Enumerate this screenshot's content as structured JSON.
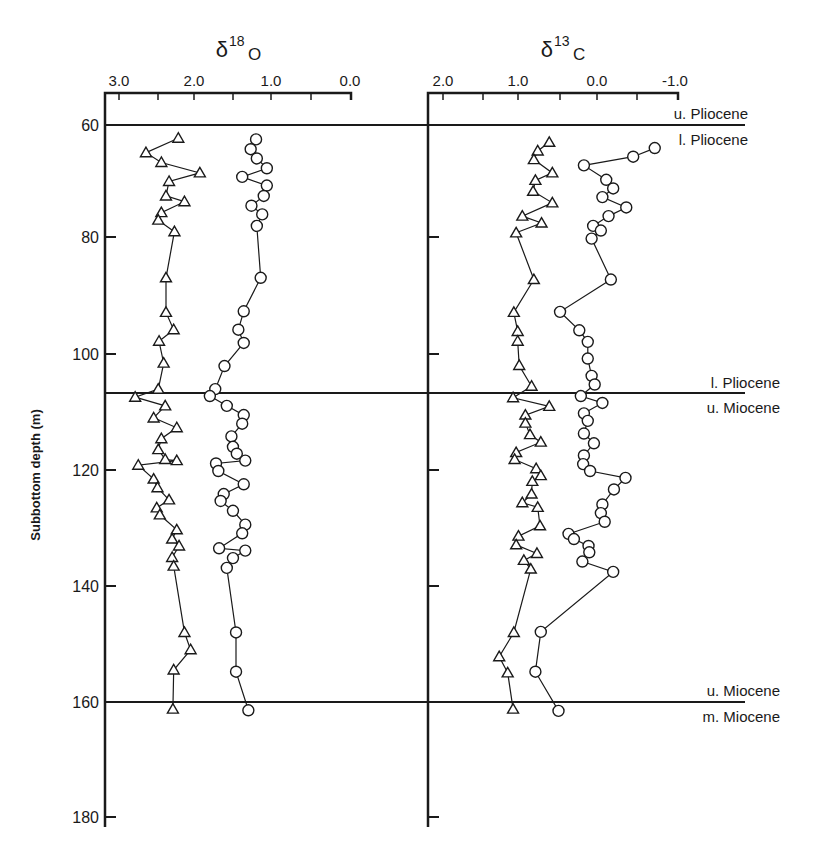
{
  "chart_data": [
    {
      "type": "line",
      "panel": "left",
      "title": "δ18O",
      "title_parts": {
        "base": "δ",
        "sup": "18",
        "sub": "O"
      },
      "xlabel": "δ18O",
      "ylabel": "Subbottom depth (m)",
      "x_ticks": [
        "3.0",
        "2.0",
        "1.0",
        "0.0"
      ],
      "x_tick_values": [
        3.0,
        2.0,
        1.0,
        0.0
      ],
      "xlim": [
        3.1,
        0.0
      ],
      "x_reversed": true,
      "y_ticks": [
        "60",
        "80",
        "100",
        "120",
        "140",
        "160",
        "180"
      ],
      "y_tick_values": [
        60,
        80,
        100,
        120,
        140,
        160,
        180
      ],
      "ylim": [
        55,
        182
      ],
      "y_reversed": true,
      "grid": false,
      "series": [
        {
          "name": "triangles",
          "marker": "triangle",
          "points": [
            [
              2.23,
              62.3
            ],
            [
              2.65,
              64.8
            ],
            [
              2.45,
              66.5
            ],
            [
              1.95,
              68.3
            ],
            [
              2.35,
              69.8
            ],
            [
              2.39,
              72.3
            ],
            [
              2.15,
              73.3
            ],
            [
              2.45,
              75.2
            ],
            [
              2.49,
              76.5
            ],
            [
              2.28,
              78.5
            ],
            [
              2.39,
              86.5
            ],
            [
              2.39,
              92.5
            ],
            [
              2.29,
              95.5
            ],
            [
              2.48,
              97.5
            ],
            [
              2.42,
              101.3
            ],
            [
              2.49,
              105.8
            ],
            [
              2.79,
              107.2
            ],
            [
              2.4,
              108.7
            ],
            [
              2.55,
              110.8
            ],
            [
              2.25,
              112.5
            ],
            [
              2.45,
              114.4
            ],
            [
              2.49,
              116.3
            ],
            [
              2.4,
              118.0
            ],
            [
              2.25,
              118.2
            ],
            [
              2.75,
              119.0
            ],
            [
              2.55,
              121.4
            ],
            [
              2.5,
              122.9
            ],
            [
              2.35,
              125.0
            ],
            [
              2.51,
              126.4
            ],
            [
              2.47,
              127.6
            ],
            [
              2.25,
              130.2
            ],
            [
              2.31,
              131.8
            ],
            [
              2.22,
              133.0
            ],
            [
              2.31,
              135.0
            ],
            [
              2.29,
              136.5
            ],
            [
              2.15,
              148.0
            ],
            [
              2.07,
              151.0
            ],
            [
              2.29,
              154.5
            ],
            [
              2.3,
              161.3
            ]
          ]
        },
        {
          "name": "circles",
          "marker": "circle",
          "points": [
            [
              1.22,
              62.5
            ],
            [
              1.29,
              64.2
            ],
            [
              1.21,
              65.8
            ],
            [
              1.08,
              67.5
            ],
            [
              1.4,
              69.0
            ],
            [
              1.08,
              70.5
            ],
            [
              1.12,
              72.3
            ],
            [
              1.28,
              74.0
            ],
            [
              1.14,
              75.5
            ],
            [
              1.21,
              77.5
            ],
            [
              1.16,
              86.5
            ],
            [
              1.38,
              92.3
            ],
            [
              1.45,
              95.5
            ],
            [
              1.38,
              97.8
            ],
            [
              1.63,
              101.8
            ],
            [
              1.75,
              105.8
            ],
            [
              1.82,
              107.0
            ],
            [
              1.6,
              108.7
            ],
            [
              1.38,
              110.3
            ],
            [
              1.4,
              111.8
            ],
            [
              1.54,
              114.0
            ],
            [
              1.52,
              115.8
            ],
            [
              1.47,
              117.0
            ],
            [
              1.36,
              118.2
            ],
            [
              1.74,
              118.7
            ],
            [
              1.71,
              120.0
            ],
            [
              1.38,
              122.3
            ],
            [
              1.64,
              124.0
            ],
            [
              1.68,
              125.2
            ],
            [
              1.52,
              126.9
            ],
            [
              1.36,
              129.3
            ],
            [
              1.4,
              130.8
            ],
            [
              1.7,
              133.4
            ],
            [
              1.36,
              133.8
            ],
            [
              1.52,
              135.1
            ],
            [
              1.6,
              136.8
            ],
            [
              1.48,
              148.0
            ],
            [
              1.48,
              154.8
            ],
            [
              1.32,
              161.5
            ]
          ]
        }
      ]
    },
    {
      "type": "line",
      "panel": "right",
      "title": "δ13C",
      "title_parts": {
        "base": "δ",
        "sup": "13",
        "sub": "C"
      },
      "xlabel": "δ13C",
      "x_ticks": [
        "2.0",
        "1.0",
        "0.0",
        "-1.0"
      ],
      "x_tick_values": [
        2.0,
        1.0,
        0.0,
        -1.0
      ],
      "xlim": [
        2.1,
        -1.0
      ],
      "x_reversed": true,
      "y_ticks": [
        "60",
        "80",
        "100",
        "120",
        "140",
        "160",
        "180"
      ],
      "y_tick_values": [
        60,
        80,
        100,
        120,
        140,
        160,
        180
      ],
      "ylim": [
        55,
        182
      ],
      "y_reversed": true,
      "grid": false,
      "series": [
        {
          "name": "triangles",
          "marker": "triangle",
          "points": [
            [
              0.62,
              63.0
            ],
            [
              0.77,
              64.5
            ],
            [
              0.82,
              66.0
            ],
            [
              0.58,
              68.3
            ],
            [
              0.8,
              69.6
            ],
            [
              0.83,
              71.5
            ],
            [
              0.58,
              73.5
            ],
            [
              0.97,
              75.8
            ],
            [
              0.72,
              77.0
            ],
            [
              1.05,
              78.7
            ],
            [
              0.82,
              86.8
            ],
            [
              1.08,
              92.5
            ],
            [
              1.03,
              95.8
            ],
            [
              1.03,
              97.5
            ],
            [
              1.01,
              101.7
            ],
            [
              0.85,
              105.3
            ],
            [
              1.09,
              107.3
            ],
            [
              0.62,
              108.8
            ],
            [
              0.93,
              110.3
            ],
            [
              0.93,
              111.7
            ],
            [
              0.87,
              113.7
            ],
            [
              0.73,
              115.0
            ],
            [
              1.05,
              116.8
            ],
            [
              1.07,
              118.0
            ],
            [
              0.79,
              119.6
            ],
            [
              0.73,
              120.8
            ],
            [
              0.84,
              121.8
            ],
            [
              0.85,
              124.0
            ],
            [
              0.97,
              125.5
            ],
            [
              0.77,
              126.3
            ],
            [
              0.74,
              129.5
            ],
            [
              1.02,
              131.3
            ],
            [
              1.05,
              132.8
            ],
            [
              0.78,
              134.3
            ],
            [
              0.95,
              135.5
            ],
            [
              0.86,
              137.0
            ],
            [
              1.08,
              148.0
            ],
            [
              1.27,
              152.2
            ],
            [
              1.16,
              155.0
            ],
            [
              1.09,
              161.3
            ]
          ]
        },
        {
          "name": "circles",
          "marker": "circle",
          "points": [
            [
              -0.75,
              64.0
            ],
            [
              -0.47,
              65.5
            ],
            [
              0.17,
              67.0
            ],
            [
              -0.12,
              69.5
            ],
            [
              -0.21,
              71.0
            ],
            [
              -0.07,
              72.5
            ],
            [
              -0.38,
              74.3
            ],
            [
              -0.15,
              75.8
            ],
            [
              0.05,
              77.5
            ],
            [
              -0.05,
              78.3
            ],
            [
              0.07,
              79.7
            ],
            [
              -0.18,
              86.8
            ],
            [
              0.48,
              92.4
            ],
            [
              0.23,
              95.6
            ],
            [
              0.12,
              97.6
            ],
            [
              0.12,
              100.5
            ],
            [
              0.07,
              103.5
            ],
            [
              0.03,
              105.0
            ],
            [
              0.21,
              107.0
            ],
            [
              -0.07,
              108.2
            ],
            [
              0.17,
              110.0
            ],
            [
              0.12,
              111.3
            ],
            [
              0.17,
              113.5
            ],
            [
              0.04,
              115.2
            ],
            [
              0.17,
              117.3
            ],
            [
              0.18,
              118.8
            ],
            [
              0.09,
              120.0
            ],
            [
              -0.37,
              121.2
            ],
            [
              -0.22,
              123.2
            ],
            [
              -0.07,
              125.8
            ],
            [
              -0.05,
              127.3
            ],
            [
              -0.1,
              128.8
            ],
            [
              0.37,
              130.9
            ],
            [
              0.3,
              131.8
            ],
            [
              0.11,
              133.0
            ],
            [
              0.1,
              134.1
            ],
            [
              0.19,
              135.7
            ],
            [
              -0.21,
              137.5
            ],
            [
              0.73,
              147.9
            ],
            [
              0.8,
              154.8
            ],
            [
              0.5,
              161.6
            ]
          ]
        }
      ]
    }
  ],
  "axes": {
    "left": {
      "title_base": "δ",
      "title_sup": "18",
      "title_sub": "O",
      "tick_labels": [
        "3.0",
        "2.0",
        "1.0",
        "0.0"
      ]
    },
    "right": {
      "title_base": "δ",
      "title_sup": "13",
      "title_sub": "C",
      "tick_labels": [
        "2.0",
        "1.0",
        "0.0",
        "-1.0"
      ]
    },
    "y": {
      "label": "Subbottom depth (m)",
      "tick_labels": [
        "60",
        "80",
        "100",
        "120",
        "140",
        "160",
        "180"
      ]
    }
  },
  "boundaries": [
    {
      "depth": 60,
      "above": "u. Pliocene",
      "below": "l. Pliocene"
    },
    {
      "depth": 107,
      "above": "l. Pliocene",
      "below": "u. Miocene"
    },
    {
      "depth": 160,
      "above": "u. Miocene",
      "below": "m. Miocene"
    }
  ]
}
